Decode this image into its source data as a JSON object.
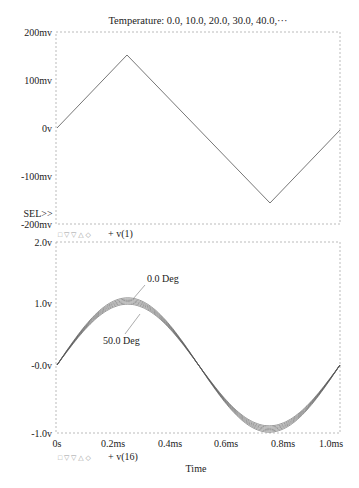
{
  "header": {
    "title": "Temperature: 0.0, 10.0, 20.0, 30.0, 40.0,···"
  },
  "colors": {
    "axis": "#aaaaaa",
    "trace": "#555555",
    "text": "#222222"
  },
  "top_plot": {
    "sel_label": "SEL>>",
    "y_ticks": [
      "200mv",
      "100mv",
      "0v",
      "-100mv",
      "-200mv"
    ],
    "legend": {
      "markers": "□ ▽ ▽ △ ◇",
      "label": "+ v(1)"
    }
  },
  "bottom_plot": {
    "y_ticks": [
      "2.0v",
      "1.0v",
      "-0.0v",
      "-1.0v"
    ],
    "x_ticks": [
      "0s",
      "0.2ms",
      "0.4ms",
      "0.6ms",
      "0.8ms",
      "1.0ms"
    ],
    "x_label": "Time",
    "annotations": [
      "0.0 Deg",
      "50.0 Deg"
    ],
    "legend": {
      "markers": "□ ▽ ▽ △ ◇",
      "label": "+ v(16)"
    }
  },
  "chart_data": [
    {
      "type": "line",
      "title": "Temperature: 0.0, 10.0, 20.0, 30.0, 40.0,...",
      "xlabel": "Time",
      "ylabel": "",
      "ylim": [
        -0.2,
        0.2
      ],
      "xlim": [
        0,
        1.0
      ],
      "y_tick_labels": [
        "200mv",
        "100mv",
        "0v",
        "-100mv",
        "-200mv"
      ],
      "series": [
        {
          "name": "v(1)",
          "x_ms": [
            0,
            0.25,
            0.75,
            1.0
          ],
          "values_v": [
            0,
            0.15,
            -0.15,
            0
          ]
        }
      ],
      "legend": [
        "v(1)"
      ],
      "grid": false
    },
    {
      "type": "line",
      "xlabel": "Time",
      "ylabel": "",
      "ylim": [
        -1.0,
        2.0
      ],
      "xlim": [
        0,
        1.0
      ],
      "x_tick_labels": [
        "0s",
        "0.2ms",
        "0.4ms",
        "0.6ms",
        "0.8ms",
        "1.0ms"
      ],
      "y_tick_labels": [
        "2.0v",
        "1.0v",
        "-0.0v",
        "-1.0v"
      ],
      "series": [
        {
          "name": "v(16) @ 0.0 Deg",
          "amplitude_v": 1.05
        },
        {
          "name": "v(16) @ 10.0 Deg",
          "amplitude_v": 1.03
        },
        {
          "name": "v(16) @ 20.0 Deg",
          "amplitude_v": 1.01
        },
        {
          "name": "v(16) @ 30.0 Deg",
          "amplitude_v": 0.99
        },
        {
          "name": "v(16) @ 40.0 Deg",
          "amplitude_v": 0.97
        },
        {
          "name": "v(16) @ 50.0 Deg",
          "amplitude_v": 0.95
        }
      ],
      "waveform": "sine, 1 period over 1.0ms",
      "annotations": [
        "0.0 Deg",
        "50.0 Deg"
      ],
      "legend": [
        "v(16)"
      ],
      "grid": false
    }
  ]
}
